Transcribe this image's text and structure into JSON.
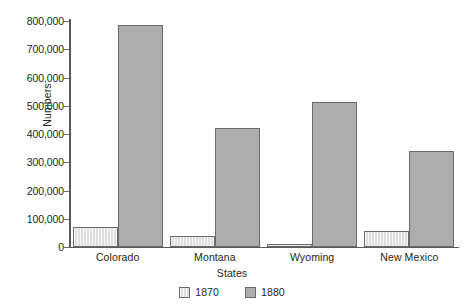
{
  "chart_data": {
    "type": "bar",
    "title": "",
    "xlabel": "States",
    "ylabel": "Numbers",
    "categories": [
      "Colorado",
      "Montana",
      "Wyoming",
      "New Mexico"
    ],
    "series": [
      {
        "name": "1870",
        "values": [
          70000,
          38000,
          12000,
          55000
        ],
        "color": "#dedede"
      },
      {
        "name": "1880",
        "values": [
          785000,
          420000,
          515000,
          340000
        ],
        "color": "#adadad"
      }
    ],
    "ylim": [
      0,
      800000
    ],
    "yticks": [
      0,
      100000,
      200000,
      300000,
      400000,
      500000,
      600000,
      700000,
      800000
    ],
    "ytick_labels": [
      "0",
      "100,000",
      "200,000",
      "300,000",
      "400,000",
      "500,000",
      "600,000",
      "700,000",
      "800,000"
    ],
    "grid": false,
    "legend_position": "bottom",
    "legend_entries": [
      "1870",
      "1880"
    ]
  }
}
